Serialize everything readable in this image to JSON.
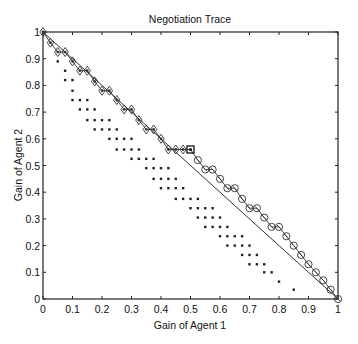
{
  "chart_data": {
    "type": "scatter",
    "title": "Negotiation Trace",
    "xlabel": "Gain of Agent 1",
    "ylabel": "Gain of Agent 2",
    "xlim": [
      0,
      1
    ],
    "ylim": [
      0,
      1
    ],
    "grid": false,
    "legend": null,
    "xticks": [
      "0",
      "0.1",
      "0.2",
      "0.3",
      "0.4",
      "0.5",
      "0.6",
      "0.7",
      "0.8",
      "0.9",
      "1"
    ],
    "yticks": [
      "0",
      "0.1",
      "0.2",
      "0.3",
      "0.4",
      "0.5",
      "0.6",
      "0.7",
      "0.8",
      "0.9",
      "1"
    ],
    "reference_line": {
      "name": "Pareto frontier",
      "x": [
        0,
        1
      ],
      "y": [
        1,
        0
      ]
    },
    "series": [
      {
        "name": "Agent 1 offers",
        "marker": "diamond",
        "x": [
          0.0,
          0.025,
          0.05,
          0.075,
          0.1,
          0.125,
          0.15,
          0.175,
          0.2,
          0.225,
          0.25,
          0.275,
          0.3,
          0.325,
          0.35,
          0.375,
          0.4,
          0.425,
          0.45,
          0.475
        ],
        "y": [
          1.0,
          0.96,
          0.925,
          0.925,
          0.89,
          0.855,
          0.855,
          0.815,
          0.78,
          0.78,
          0.745,
          0.71,
          0.71,
          0.67,
          0.635,
          0.635,
          0.6,
          0.56,
          0.56,
          0.56
        ]
      },
      {
        "name": "Agreement",
        "marker": "square",
        "x": [
          0.5
        ],
        "y": [
          0.56
        ]
      },
      {
        "name": "Agent 2 offers",
        "marker": "circle",
        "x": [
          0.525,
          0.55,
          0.575,
          0.6,
          0.625,
          0.65,
          0.675,
          0.7,
          0.725,
          0.75,
          0.775,
          0.8,
          0.825,
          0.85,
          0.875,
          0.9,
          0.925,
          0.95,
          0.975,
          1.0
        ],
        "y": [
          0.52,
          0.485,
          0.485,
          0.45,
          0.415,
          0.415,
          0.375,
          0.34,
          0.34,
          0.305,
          0.27,
          0.27,
          0.235,
          0.2,
          0.165,
          0.13,
          0.1,
          0.07,
          0.035,
          0.0
        ]
      },
      {
        "name": "Explored offers",
        "marker": "dot",
        "rows": [
          {
            "y": 0.89,
            "x": [
              0.05
            ]
          },
          {
            "y": 0.855,
            "x": [
              0.075
            ]
          },
          {
            "y": 0.82,
            "x": [
              0.075,
              0.1
            ]
          },
          {
            "y": 0.78,
            "x": [
              0.1
            ]
          },
          {
            "y": 0.745,
            "x": [
              0.1,
              0.125,
              0.15
            ]
          },
          {
            "y": 0.71,
            "x": [
              0.125,
              0.15,
              0.175
            ]
          },
          {
            "y": 0.67,
            "x": [
              0.15,
              0.175,
              0.2,
              0.225
            ]
          },
          {
            "y": 0.635,
            "x": [
              0.175,
              0.2,
              0.225,
              0.25
            ]
          },
          {
            "y": 0.6,
            "x": [
              0.225,
              0.25,
              0.275,
              0.3
            ]
          },
          {
            "y": 0.56,
            "x": [
              0.25,
              0.275,
              0.3,
              0.325
            ]
          },
          {
            "y": 0.525,
            "x": [
              0.3,
              0.325,
              0.35,
              0.375
            ]
          },
          {
            "y": 0.49,
            "x": [
              0.35,
              0.375,
              0.4,
              0.425
            ]
          },
          {
            "y": 0.45,
            "x": [
              0.375,
              0.4,
              0.425,
              0.45
            ]
          },
          {
            "y": 0.415,
            "x": [
              0.4,
              0.425,
              0.45,
              0.475
            ]
          },
          {
            "y": 0.375,
            "x": [
              0.45,
              0.475,
              0.5,
              0.525
            ]
          },
          {
            "y": 0.34,
            "x": [
              0.5,
              0.525,
              0.55,
              0.575
            ]
          },
          {
            "y": 0.305,
            "x": [
              0.525,
              0.55,
              0.575,
              0.6
            ]
          },
          {
            "y": 0.27,
            "x": [
              0.55,
              0.575,
              0.6,
              0.625
            ]
          },
          {
            "y": 0.235,
            "x": [
              0.6,
              0.625,
              0.65,
              0.675
            ]
          },
          {
            "y": 0.2,
            "x": [
              0.625,
              0.65,
              0.675,
              0.7
            ]
          },
          {
            "y": 0.165,
            "x": [
              0.675,
              0.7,
              0.725
            ]
          },
          {
            "y": 0.13,
            "x": [
              0.7,
              0.725,
              0.75
            ]
          },
          {
            "y": 0.1,
            "x": [
              0.75,
              0.775
            ]
          },
          {
            "y": 0.065,
            "x": [
              0.8
            ]
          },
          {
            "y": 0.035,
            "x": [
              0.85
            ]
          }
        ]
      }
    ]
  }
}
